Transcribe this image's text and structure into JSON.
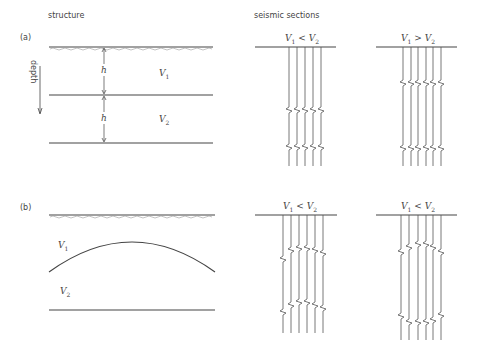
{
  "headers": {
    "structure": "structure",
    "seismic": "seismic sections"
  },
  "panels": {
    "a": {
      "label": "(a)",
      "depth_label": "depth",
      "thickness_label": "h",
      "layer1": "V",
      "layer1_sub": "1",
      "layer2": "V",
      "layer2_sub": "2",
      "section_left": {
        "title_v1": "V",
        "sub1": "1",
        "op": "<",
        "title_v2": "V",
        "sub2": "2"
      },
      "section_right": {
        "title_v1": "V",
        "sub1": "1",
        "op": ">",
        "title_v2": "V",
        "sub2": "2"
      }
    },
    "b": {
      "label": "(b)",
      "layer1": "V",
      "layer1_sub": "1",
      "layer2": "V",
      "layer2_sub": "2",
      "section_left": {
        "title_v1": "V",
        "sub1": "1",
        "op": "<",
        "title_v2": "V",
        "sub2": "2"
      },
      "section_right": {
        "title_v1": "V",
        "sub1": "1",
        "op": "<",
        "title_v2": "V",
        "sub2": "2"
      }
    }
  },
  "sections": [
    {
      "id": "a-left",
      "line": [
        255,
        336,
        47
      ],
      "traces": [
        289,
        297,
        305,
        313,
        321
      ],
      "bottom": 166,
      "events": [
        [
          110,
          110,
          110,
          110,
          110
        ],
        [
          147,
          147,
          147,
          147,
          147
        ]
      ]
    },
    {
      "id": "a-right",
      "line": [
        376,
        457,
        47
      ],
      "traces": [
        403,
        411,
        418,
        426,
        433,
        441
      ],
      "bottom": 166,
      "events": [
        [
          83,
          83,
          83,
          83,
          83,
          83
        ],
        [
          148,
          148,
          148,
          148,
          148,
          148
        ]
      ]
    },
    {
      "id": "b-left",
      "line": [
        255,
        337,
        215
      ],
      "traces": [
        283,
        291,
        299,
        307,
        315,
        323
      ],
      "bottom": 333,
      "events": [
        [
          259,
          250,
          248,
          248,
          250,
          253
        ],
        [
          312,
          305,
          302,
          302,
          305,
          308
        ]
      ]
    },
    {
      "id": "b-right",
      "line": [
        376,
        457,
        215
      ],
      "traces": [
        401,
        409,
        418,
        426,
        433,
        441
      ],
      "bottom": 340,
      "events": [
        [
          252,
          247,
          244,
          244,
          247,
          252
        ],
        [
          316,
          322,
          322,
          322,
          320,
          315
        ]
      ]
    }
  ]
}
